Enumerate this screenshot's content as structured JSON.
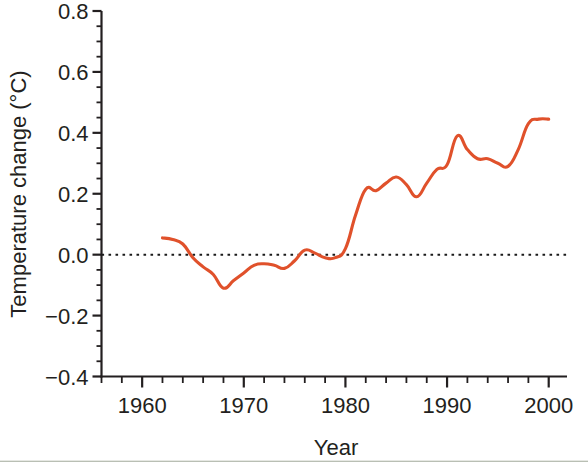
{
  "chart_data": {
    "type": "line",
    "title": "",
    "xlabel": "Year",
    "ylabel": "Temperature change (°C)",
    "xlim": [
      1956,
      2001.8
    ],
    "ylim": [
      -0.4,
      0.8
    ],
    "grid": false,
    "legend": null,
    "line_color": "#E0512B",
    "zero_reference_line": 0.0,
    "x_ticks_major": [
      1960,
      1970,
      1980,
      1990,
      2000
    ],
    "x_tick_labels": [
      "1960",
      "1970",
      "1980",
      "1990",
      "2000"
    ],
    "x_minor_tick_interval": 2,
    "y_ticks_major": [
      -0.4,
      -0.2,
      0.0,
      0.2,
      0.4,
      0.6,
      0.8
    ],
    "y_tick_labels": [
      "−0.4",
      "−0.2",
      "0.0",
      "0.2",
      "0.4",
      "0.6",
      "0.8"
    ],
    "y_minor_tick_interval": 0.05,
    "series": [
      {
        "name": "Temperature change",
        "color": "#E0512B",
        "x": [
          1962,
          1963,
          1964,
          1965,
          1966,
          1967,
          1968,
          1969,
          1970,
          1971,
          1972,
          1973,
          1974,
          1975,
          1976,
          1977,
          1978,
          1979,
          1980,
          1981,
          1982,
          1983,
          1984,
          1985,
          1986,
          1987,
          1988,
          1989,
          1990,
          1991,
          1992,
          1993,
          1994,
          1995,
          1996,
          1997,
          1998,
          1999,
          2000
        ],
        "values": [
          0.055,
          0.05,
          0.035,
          -0.01,
          -0.04,
          -0.065,
          -0.11,
          -0.085,
          -0.06,
          -0.035,
          -0.03,
          -0.035,
          -0.045,
          -0.02,
          0.015,
          0.005,
          -0.01,
          -0.01,
          0.02,
          0.13,
          0.215,
          0.21,
          0.235,
          0.255,
          0.23,
          0.19,
          0.235,
          0.28,
          0.295,
          0.39,
          0.345,
          0.315,
          0.315,
          0.3,
          0.29,
          0.345,
          0.43,
          0.445,
          0.445
        ]
      }
    ]
  },
  "axes": {
    "y_label": "Temperature change (°C)",
    "x_label": "Year"
  }
}
